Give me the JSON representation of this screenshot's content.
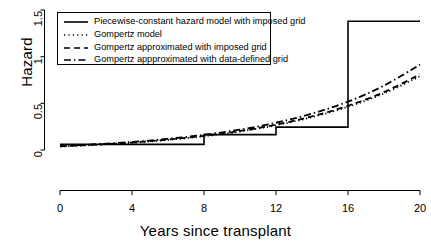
{
  "chart_data": {
    "type": "line",
    "title": "",
    "xlabel": "Years since transplant",
    "ylabel": "Hazard",
    "xlim": [
      0,
      20
    ],
    "ylim": [
      0,
      1.5
    ],
    "xticks": [
      0,
      4,
      8,
      12,
      16,
      20
    ],
    "xtick_labels": [
      "0",
      "4",
      "8",
      "12",
      "16",
      "20"
    ],
    "yticks": [
      0,
      0.5,
      1,
      1.5
    ],
    "ytick_labels": [
      "0",
      "0.5",
      "1",
      "1.5"
    ],
    "grid": false,
    "legend_position": "top-left",
    "series": [
      {
        "name": "Piecewise-constant hazard model with imposed grid",
        "style": "solid",
        "type": "step",
        "breakpoints": [
          0,
          8,
          12,
          16,
          20
        ],
        "levels": [
          0.06,
          0.165,
          0.245,
          1.38
        ]
      },
      {
        "name": "Gompertz model",
        "style": "dotted",
        "type": "curve",
        "x": [
          0,
          2,
          4,
          6,
          8,
          10,
          12,
          14,
          16,
          18,
          20
        ],
        "y": [
          0.038,
          0.055,
          0.078,
          0.108,
          0.147,
          0.198,
          0.265,
          0.352,
          0.463,
          0.606,
          0.79
        ]
      },
      {
        "name": "Gompertz approximated with imposed grid",
        "style": "dashed",
        "type": "curve",
        "x": [
          0,
          2,
          4,
          6,
          8,
          10,
          12,
          14,
          16,
          18,
          20
        ],
        "y": [
          0.04,
          0.058,
          0.08,
          0.112,
          0.152,
          0.204,
          0.272,
          0.36,
          0.474,
          0.62,
          0.81
        ]
      },
      {
        "name": "Gompertz appproximated with data-defined grid",
        "style": "dashdot",
        "type": "curve",
        "x": [
          0,
          2,
          4,
          6,
          8,
          10,
          12,
          14,
          16,
          18,
          20
        ],
        "y": [
          0.042,
          0.062,
          0.086,
          0.12,
          0.163,
          0.219,
          0.292,
          0.39,
          0.518,
          0.69,
          0.915
        ]
      }
    ]
  },
  "axes": {
    "y_label": "Hazard",
    "x_label": "Years since transplant",
    "x_tick_labels": [
      "0",
      "4",
      "8",
      "12",
      "16",
      "20"
    ],
    "y_tick_labels": [
      "0",
      "0.5",
      "1",
      "1.5"
    ]
  },
  "legend": {
    "entries": [
      {
        "label": "Piecewise-constant hazard model with imposed grid",
        "style": "solid"
      },
      {
        "label": "Gompertz model",
        "style": "dotted"
      },
      {
        "label": "Gompertz approximated with imposed grid",
        "style": "dashed"
      },
      {
        "label": "Gompertz appproximated with data-defined grid",
        "style": "dashdot"
      }
    ]
  },
  "colors": {
    "line": "#000000",
    "axis": "#000000",
    "background": "#ffffff",
    "legend_border": "#000000"
  }
}
